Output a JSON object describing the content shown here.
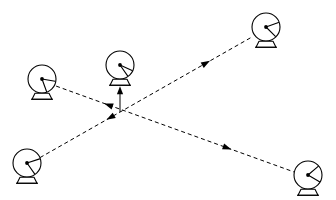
{
  "diagram": {
    "type": "node-link",
    "background_color": "#ffffff",
    "line_color": "#000000",
    "canvas": {
      "width": 336,
      "height": 200
    },
    "crossing_point": {
      "x": 120,
      "y": 120
    },
    "nodes": [
      {
        "id": "dish-top-left",
        "label": "",
        "role": "satellite-dish-antenna",
        "center": {
          "x": 42,
          "y": 79
        },
        "radius": 14,
        "feed_angle_deg": 10,
        "sub_arm_angle_deg": 70
      },
      {
        "id": "dish-top-center",
        "label": "",
        "role": "satellite-dish-antenna",
        "center": {
          "x": 120,
          "y": 65
        },
        "radius": 14,
        "feed_angle_deg": 25,
        "sub_arm_angle_deg": 55
      },
      {
        "id": "dish-top-right",
        "label": "",
        "role": "satellite-dish-antenna",
        "center": {
          "x": 266,
          "y": 27
        },
        "radius": 14,
        "feed_angle_deg": -20,
        "sub_arm_angle_deg": 45
      },
      {
        "id": "dish-bottom-left",
        "label": "",
        "role": "satellite-dish-antenna",
        "center": {
          "x": 27,
          "y": 163
        },
        "radius": 14,
        "feed_angle_deg": -18,
        "sub_arm_angle_deg": 55
      },
      {
        "id": "dish-bottom-right",
        "label": "",
        "role": "satellite-dish-antenna",
        "center": {
          "x": 308,
          "y": 175
        },
        "radius": 14,
        "feed_angle_deg": -40,
        "sub_arm_angle_deg": 30
      }
    ],
    "links": [
      {
        "id": "link-bottom-left-to-top-right",
        "from": "dish-bottom-left",
        "to": "dish-top-right",
        "style": "dashed",
        "arrow_count": 2,
        "arrow_direction": "bidirectional-outward",
        "arrow_positions": [
          0.33,
          0.78
        ]
      },
      {
        "id": "link-top-left-to-bottom-right",
        "from": "dish-top-left",
        "to": "dish-bottom-right",
        "style": "dashed",
        "arrow_count": 2,
        "arrow_direction": "bidirectional-outward",
        "arrow_positions": [
          0.22,
          0.72
        ]
      },
      {
        "id": "link-center-to-top-center",
        "from": "crossing-point",
        "to": "dish-top-center",
        "style": "solid",
        "arrow_count": 1,
        "arrow_direction": "up",
        "arrow_positions": [
          1.0
        ]
      }
    ]
  }
}
